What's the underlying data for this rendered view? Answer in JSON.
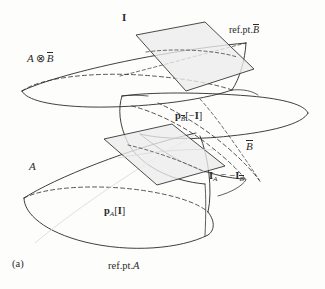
{
  "figure": {
    "subfigure_marker": "(a)",
    "background_color": "#fdfdfc",
    "ink_color": "#2a2a2a",
    "plane_fill_color": "#ececec",
    "width": 325,
    "height": 289
  },
  "labels": {
    "plane_I": "I",
    "refpt_bbar_prefix": "ref.pt.",
    "refpt_bbar_symbol": "B",
    "a_tensor_bbar": {
      "a": "A",
      "operator": "⊗",
      "bbar": "B"
    },
    "projection_bbar": {
      "p": "p",
      "sub": "B",
      "bracket_open": "[",
      "minus": "−",
      "arg": "I",
      "bracket_close": "]"
    },
    "bbar": "B",
    "a": "A",
    "identity_equation": {
      "I": "I",
      "sub_a": "A",
      "equals": "=",
      "minus": "−",
      "I2": "I",
      "sub_bbar": "B"
    },
    "projection_a": {
      "p": "p",
      "sub": "A",
      "bracket_open": "[",
      "arg": "I",
      "bracket_close": "]"
    },
    "refpt_a_prefix": "ref.pt.",
    "refpt_a_symbol": "A"
  },
  "geometry": {
    "shapes": [
      {
        "name": "upper-cone-a-tensor-bbar",
        "kind": "cone"
      },
      {
        "name": "middle-cone-bbar",
        "kind": "cone"
      },
      {
        "name": "lower-cone-a",
        "kind": "cone"
      },
      {
        "name": "upper-plane-I",
        "kind": "parallelogram"
      },
      {
        "name": "lower-plane-IA",
        "kind": "parallelogram"
      }
    ]
  }
}
